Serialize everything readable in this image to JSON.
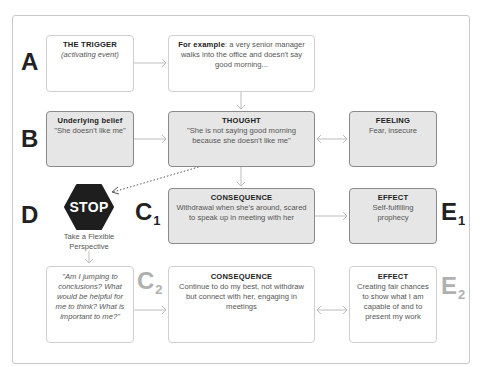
{
  "diagram": {
    "rows": {
      "A": {
        "letter": "A",
        "trigger": {
          "title": "THE TRIGGER",
          "subtitle": "(activating event)"
        },
        "example": {
          "bold": "For example",
          "text": ": a very senior manager walks into the office and doesn't say good morning..."
        }
      },
      "B": {
        "letter": "B",
        "belief": {
          "title": "Underlying belief",
          "text": "\"She doesn't like me\""
        },
        "thought": {
          "title": "THOUGHT",
          "text": "\"She is not saying good morning because she doesn't like me\""
        },
        "feeling": {
          "title": "FEELING",
          "text": "Fear, insecure"
        }
      },
      "C1": {
        "letter": "C",
        "subscript": "1",
        "consequence": {
          "title": "CONSEQUENCE",
          "text": "Withdrawal when she's around, scared to speak up in meeting with her"
        }
      },
      "E1": {
        "letter": "E",
        "subscript": "1",
        "effect": {
          "title": "EFFECT",
          "text": "Self-fulfilling prophecy"
        }
      },
      "D": {
        "letter": "D",
        "stop_sign": "STOP",
        "stop_label": "Take a Flexible Perspective",
        "questions": "\"Am I jumping to conclusions? What would be helpful for me to think? What is important to me?\""
      },
      "C2": {
        "letter": "C",
        "subscript": "2",
        "consequence": {
          "title": "CONSEQUENCE",
          "text": "Continue to do my best, not withdraw but connect with her, engaging in meetings"
        }
      },
      "E2": {
        "letter": "E",
        "subscript": "2",
        "effect": {
          "title": "EFFECT",
          "text": "Creating fair chances to show what I am capable of and to present my work"
        }
      }
    },
    "colors": {
      "shaded_box": "#e6e6e6",
      "letter_dark": "#222222",
      "letter_grey": "#b0b0b0",
      "arrow": "#bdbdbd",
      "stop_sign": "#1e1e1e"
    }
  }
}
